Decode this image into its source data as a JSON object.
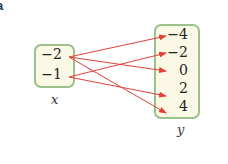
{
  "corner_label": "a",
  "domain_set": {
    "label": "x",
    "values": [
      "−2",
      "−1"
    ]
  },
  "codomain_set": {
    "label": "y",
    "values": [
      "−4",
      "−2",
      "0",
      "2",
      "4"
    ]
  },
  "mappings": [
    {
      "from": "−2",
      "to": "−4"
    },
    {
      "from": "−2",
      "to": "0"
    },
    {
      "from": "−2",
      "to": "4"
    },
    {
      "from": "−1",
      "to": "−2"
    },
    {
      "from": "−1",
      "to": "2"
    }
  ],
  "colors": {
    "arrow": "#e0413a",
    "box_border": "#9cc18c",
    "box_fill": "#fbf8e6"
  }
}
